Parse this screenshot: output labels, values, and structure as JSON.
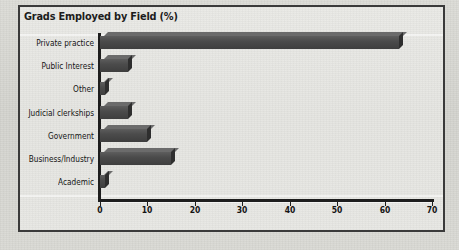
{
  "figure": {
    "title": "Grads Employed by Field (%)",
    "frame_color": "#3a3a3a",
    "bar_color": "#4b4b4b",
    "background_color": "#e7e7e3"
  },
  "chart_data": {
    "type": "bar",
    "orientation": "horizontal",
    "title": "Grads Employed by Field (%)",
    "xlabel": "",
    "ylabel": "",
    "xlim": [
      0,
      70
    ],
    "xticks": [
      0,
      10,
      20,
      30,
      40,
      50,
      60,
      70
    ],
    "grid": false,
    "legend": null,
    "categories": [
      "Private practice",
      "Public Interest",
      "Other",
      "Judicial clerkships",
      "Government",
      "Business/Industry",
      "Academic"
    ],
    "values": [
      63,
      6,
      1,
      6,
      10,
      15,
      1
    ],
    "series": [
      {
        "name": "Grads Employed by Field (%)",
        "values": [
          63,
          6,
          1,
          6,
          10,
          15,
          1
        ]
      }
    ]
  }
}
